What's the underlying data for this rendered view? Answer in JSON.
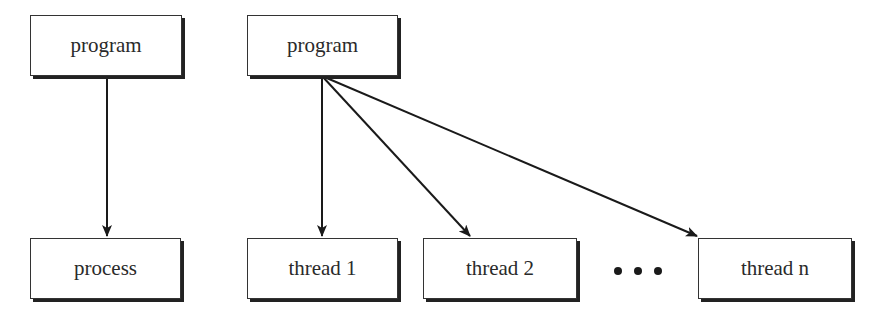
{
  "diagram": {
    "left": {
      "source": {
        "label": "program"
      },
      "target": {
        "label": "process"
      }
    },
    "right": {
      "source": {
        "label": "program"
      },
      "targets": [
        {
          "label": "thread 1"
        },
        {
          "label": "thread 2"
        },
        {
          "label": "thread n"
        }
      ],
      "ellipsis": "..."
    },
    "colors": {
      "stroke": "#1a1a1a",
      "background": "#ffffff",
      "text": "#2a2a2a"
    }
  }
}
